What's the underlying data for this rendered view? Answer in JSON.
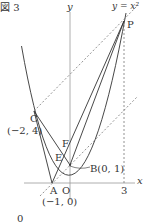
{
  "figure": {
    "title": "図 3",
    "curve_label": "y = x²",
    "axis_x_label": "x",
    "axis_y_label": "y",
    "origin_label": "O",
    "tick_x3_label": "3",
    "bottom_fragment": "0"
  },
  "points": {
    "P": {
      "label": "P"
    },
    "C": {
      "label": "C",
      "coords": "(−2, 4)"
    },
    "A": {
      "label": "A",
      "coords": "(−1, 0)"
    },
    "B": {
      "label": "B(0, 1)"
    },
    "E": {
      "label": "E"
    },
    "F": {
      "label": "F"
    }
  },
  "colors": {
    "line": "#333333",
    "axis": "#9a9a9a",
    "dashed": "#777777"
  }
}
